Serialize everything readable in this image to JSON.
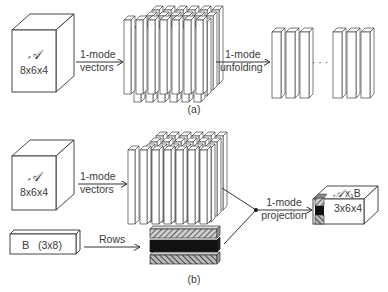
{
  "panel_a": {
    "tensor": {
      "symbol": "𝒜",
      "dims": "8x6x4"
    },
    "arrow1": {
      "line1": "1-mode",
      "line2": "vectors"
    },
    "arrow2": {
      "line1": "1-mode",
      "line2": "unfolding"
    },
    "ellipsis": "· · ·",
    "caption": "(a)"
  },
  "panel_b": {
    "tensor": {
      "symbol": "𝒜",
      "dims": "8x6x4"
    },
    "arrow1": {
      "line1": "1-mode",
      "line2": "vectors"
    },
    "matrix": {
      "name": "B",
      "dims": "(3x8)"
    },
    "rows_label": "Rows",
    "projection": {
      "line1": "1-mode",
      "line2": "projection"
    },
    "result": {
      "symbol": "𝒜",
      "op": "x₁B",
      "dims": "3x6x4"
    },
    "caption": "(b)"
  },
  "colors": {
    "stroke": "#333333",
    "dark_row": "#111111",
    "hatch": "#777777",
    "background": "#ffffff"
  }
}
